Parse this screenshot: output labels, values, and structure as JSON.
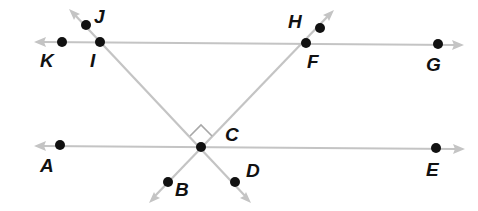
{
  "diagram": {
    "colors": {
      "line": "#c4c4c4",
      "point": "#111111",
      "label": "#111111"
    },
    "lines": [
      {
        "name": "line-KG",
        "through": [
          "K",
          "I",
          "F",
          "G"
        ],
        "from": [
          35,
          42
        ],
        "to": [
          463,
          45
        ]
      },
      {
        "name": "line-AE",
        "through": [
          "A",
          "C",
          "E"
        ],
        "from": [
          35,
          146
        ],
        "to": [
          464,
          149
        ]
      },
      {
        "name": "line-JD",
        "through": [
          "J",
          "I",
          "C",
          "D"
        ],
        "from": [
          70,
          10
        ],
        "to": [
          250,
          202
        ]
      },
      {
        "name": "line-HB",
        "through": [
          "H",
          "F",
          "C",
          "B"
        ],
        "from": [
          333,
          10
        ],
        "to": [
          150,
          202
        ]
      }
    ],
    "points": [
      {
        "id": "K",
        "label": "K",
        "x": 62,
        "y": 42,
        "lx": 40,
        "ly": 67
      },
      {
        "id": "I",
        "label": "I",
        "x": 100,
        "y": 42,
        "lx": 90,
        "ly": 67
      },
      {
        "id": "J",
        "label": "J",
        "x": 86,
        "y": 25,
        "lx": 94,
        "ly": 23
      },
      {
        "id": "F",
        "label": "F",
        "x": 306,
        "y": 43,
        "lx": 307,
        "ly": 68
      },
      {
        "id": "H",
        "label": "H",
        "x": 320,
        "y": 28,
        "lx": 288,
        "ly": 28
      },
      {
        "id": "G",
        "label": "G",
        "x": 438,
        "y": 44,
        "lx": 426,
        "ly": 71
      },
      {
        "id": "A",
        "label": "A",
        "x": 60,
        "y": 145,
        "lx": 40,
        "ly": 172
      },
      {
        "id": "C",
        "label": "C",
        "x": 201,
        "y": 147,
        "lx": 225,
        "ly": 141
      },
      {
        "id": "E",
        "label": "E",
        "x": 436,
        "y": 148,
        "lx": 426,
        "ly": 176
      },
      {
        "id": "B",
        "label": "B",
        "x": 168,
        "y": 182,
        "lx": 175,
        "ly": 196
      },
      {
        "id": "D",
        "label": "D",
        "x": 235,
        "y": 182,
        "lx": 246,
        "ly": 177
      }
    ],
    "right_angle_at": "C"
  }
}
